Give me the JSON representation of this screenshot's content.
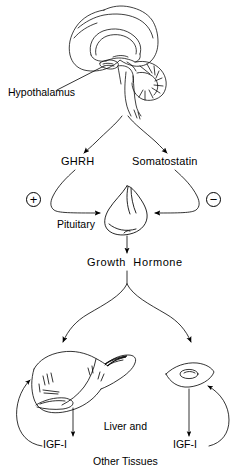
{
  "figure": {
    "kind": "biological-pathway-diagram",
    "background_color": "#ffffff",
    "line_color": "#000000",
    "width": 247,
    "height": 463
  },
  "labels": {
    "hypothalamus": "Hypothalamus",
    "ghrh": "GHRH",
    "somatostatin": "Somatostatin",
    "pituitary": "Pituitary",
    "growth_hormone": "Growth  Hormone",
    "tissues_line1": "Liver and",
    "tissues_line2": "Other Tissues",
    "igf_left": "IGF-I",
    "igf_right": "IGF-I"
  },
  "symbols": {
    "stimulatory": "+",
    "inhibitory": "−"
  },
  "illustrations": {
    "brain": "brain-sagittal-section",
    "pituitary_gland": "pituitary-gland-bulb",
    "liver": "liver-organ",
    "tissue_cell": "tissue-cell-with-nucleus"
  },
  "flow": {
    "steps": [
      "Hypothalamus releases GHRH and Somatostatin",
      "GHRH stimulates (+) the Pituitary",
      "Somatostatin inhibits (−) the Pituitary",
      "Pituitary secretes Growth Hormone",
      "Growth Hormone acts on Liver and Other Tissues",
      "Liver and Other Tissues produce IGF-I",
      "IGF-I feeds back to the tissues"
    ]
  }
}
